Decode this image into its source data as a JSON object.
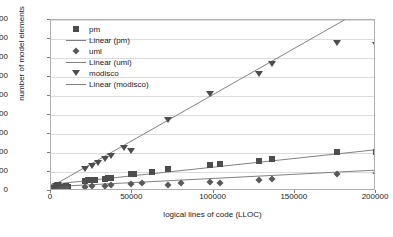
{
  "chart_data": {
    "type": "scatter",
    "title": "",
    "xlabel": "logical lines of code (LLOC)",
    "ylabel": "number of model elements",
    "xlim": [
      0,
      200000
    ],
    "ylim": [
      0,
      9000
    ],
    "xticks": [
      0,
      50000,
      100000,
      150000,
      200000
    ],
    "xtick_labels": [
      "0",
      "50000",
      "100000",
      "150000",
      "200000"
    ],
    "yticks": [
      0,
      1000,
      2000,
      3000,
      4000,
      5000,
      6000,
      7000,
      8000,
      9000
    ],
    "ytick_labels": [
      "0",
      "1000",
      "2000",
      "3000",
      "4000",
      "5000",
      "6000",
      "7000",
      "8000",
      "9000"
    ],
    "grid": "horizontal",
    "legend_position": "upper-left-inside",
    "legend_entries": [
      {
        "label": "pm",
        "marker": "square"
      },
      {
        "label": "Linear (pm)",
        "marker": "line"
      },
      {
        "label": "uml",
        "marker": "diamond"
      },
      {
        "label": "Linear (uml)",
        "marker": "line"
      },
      {
        "label": "modisco",
        "marker": "triangle-down"
      },
      {
        "label": "Linear (modisco)",
        "marker": "line"
      }
    ],
    "series": [
      {
        "name": "pm",
        "marker": "square",
        "color": "#4d4d4d",
        "points": [
          [
            1500,
            90
          ],
          [
            3000,
            120
          ],
          [
            4500,
            150
          ],
          [
            6000,
            180
          ],
          [
            7500,
            210
          ],
          [
            9000,
            250
          ],
          [
            10500,
            200
          ],
          [
            21000,
            520
          ],
          [
            23000,
            560
          ],
          [
            25000,
            600
          ],
          [
            27000,
            580
          ],
          [
            33000,
            640
          ],
          [
            35000,
            700
          ],
          [
            37000,
            660
          ],
          [
            49000,
            880
          ],
          [
            51000,
            920
          ],
          [
            62000,
            1000
          ],
          [
            72000,
            1180
          ],
          [
            98000,
            1350
          ],
          [
            104000,
            1400
          ],
          [
            128000,
            1600
          ],
          [
            136000,
            1680
          ],
          [
            176000,
            2050
          ],
          [
            200000,
            2050
          ]
        ],
        "trendline": {
          "type": "linear",
          "y_at_xmin": 240,
          "y_at_xmax": 2080
        }
      },
      {
        "name": "uml",
        "marker": "diamond",
        "color": "#595959",
        "points": [
          [
            1500,
            60
          ],
          [
            3000,
            80
          ],
          [
            4500,
            100
          ],
          [
            6000,
            110
          ],
          [
            7500,
            130
          ],
          [
            9000,
            150
          ],
          [
            21000,
            210
          ],
          [
            25000,
            250
          ],
          [
            33000,
            280
          ],
          [
            37000,
            300
          ],
          [
            49000,
            360
          ],
          [
            56000,
            400
          ],
          [
            72000,
            300
          ],
          [
            80000,
            430
          ],
          [
            98000,
            500
          ],
          [
            104000,
            430
          ],
          [
            128000,
            600
          ],
          [
            136000,
            640
          ],
          [
            176000,
            880
          ],
          [
            200000,
            950
          ]
        ],
        "trendline": {
          "type": "linear",
          "y_at_xmin": 120,
          "y_at_xmax": 1000
        }
      },
      {
        "name": "modisco",
        "marker": "triangle-down",
        "color": "#4d4d4d",
        "points": [
          [
            1500,
            150
          ],
          [
            3000,
            260
          ],
          [
            4500,
            330
          ],
          [
            21000,
            1150
          ],
          [
            25000,
            1300
          ],
          [
            29000,
            1450
          ],
          [
            33000,
            1700
          ],
          [
            37000,
            1850
          ],
          [
            45000,
            2250
          ],
          [
            49000,
            2100
          ],
          [
            72000,
            3750
          ],
          [
            98000,
            5100
          ],
          [
            128000,
            6150
          ],
          [
            136000,
            6700
          ],
          [
            176000,
            7800
          ],
          [
            200000,
            7700
          ]
        ],
        "trendline": {
          "type": "linear",
          "y_at_xmin": 120,
          "y_at_xmax": 9900
        }
      }
    ]
  }
}
